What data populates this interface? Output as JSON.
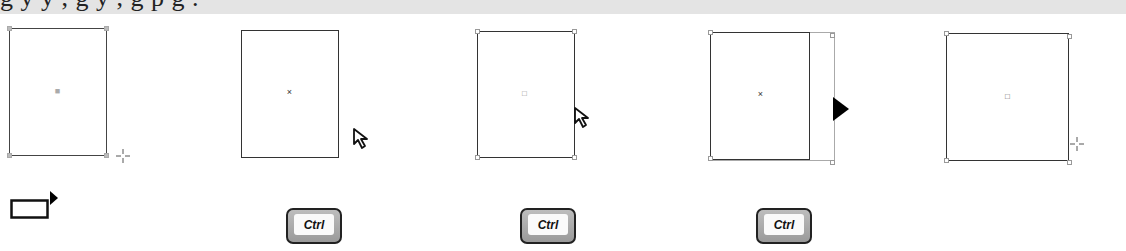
{
  "caption": {
    "partial_text": "g     y  y  ,       g  y ,       g  p         g  ."
  },
  "panels": [
    {
      "id": 1,
      "center_marker": "■",
      "cursor": "crosshair-icon"
    },
    {
      "id": 2,
      "center_marker": "×",
      "cursor": "arrow-pointer-icon"
    },
    {
      "id": 3,
      "center_marker": "□",
      "cursor": "arrow-pointer-icon"
    },
    {
      "id": 4,
      "center_marker": "×",
      "cursor": "filled-arrow-icon"
    },
    {
      "id": 5,
      "center_marker": "□",
      "cursor": "crosshair-icon"
    }
  ],
  "keys": [
    {
      "label": "Ctrl"
    },
    {
      "label": "Ctrl"
    },
    {
      "label": "Ctrl"
    }
  ],
  "tool_icon": "rectangle-tool-icon"
}
